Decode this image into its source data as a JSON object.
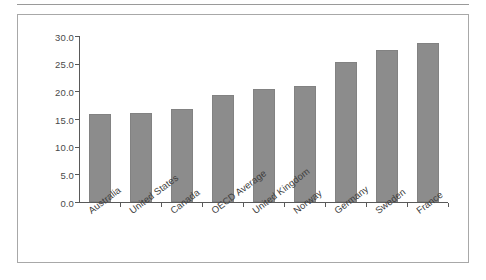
{
  "chart_data": {
    "type": "bar",
    "title": "",
    "subtitle": "",
    "xlabel": "",
    "ylabel": "",
    "categories": [
      "Australia",
      "United States",
      "Canada",
      "OECD Average",
      "United Kingdom",
      "Norway",
      "Germany",
      "Sweden",
      "France"
    ],
    "values": [
      15.9,
      16.1,
      16.8,
      19.3,
      20.5,
      20.9,
      25.3,
      27.5,
      28.7
    ],
    "ylim": [
      0.0,
      30.0
    ],
    "ytick_labels": [
      "0.0",
      "5.0",
      "10.0",
      "15.0",
      "20.0",
      "25.0",
      "30.0"
    ],
    "ytick_values": [
      0.0,
      5.0,
      10.0,
      15.0,
      20.0,
      25.0,
      30.0
    ],
    "grid": false,
    "legend": false,
    "legend_position": "none",
    "bar_color": "#8c8c8c",
    "axis_color": "#595959",
    "frame_color": "#a8a8a8",
    "label_rotation": -37
  }
}
